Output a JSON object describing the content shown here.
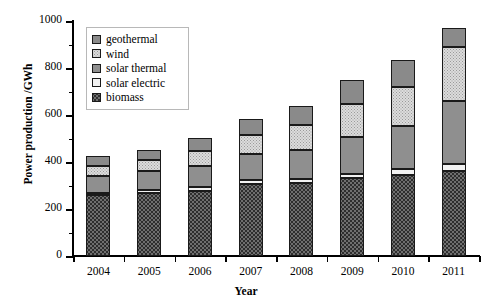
{
  "chart_data": {
    "type": "bar",
    "stacked": true,
    "title": "",
    "xlabel": "Year",
    "ylabel": "Power production /GWh",
    "categories": [
      "2004",
      "2005",
      "2006",
      "2007",
      "2008",
      "2009",
      "2010",
      "2011"
    ],
    "ylim": [
      0,
      1000
    ],
    "y_major_ticks": [
      0,
      200,
      400,
      600,
      800,
      1000
    ],
    "y_minor_ticks": [
      100,
      300,
      500,
      700,
      900
    ],
    "y_tick_labels": [
      "0",
      "200",
      "400",
      "600",
      "800",
      "1000"
    ],
    "grid": false,
    "legend_position": "top-left-inside",
    "stack_order_bottom_to_top": [
      "biomass",
      "solar electric",
      "solar thermal",
      "wind",
      "geothermal"
    ],
    "series": [
      {
        "name": "biomass",
        "color": "#6f6f6f",
        "pattern": "dense-dots",
        "values": [
          258,
          268,
          278,
          308,
          310,
          330,
          345,
          363
        ]
      },
      {
        "name": "solar electric",
        "color": "#f2f2f2",
        "pattern": "solid",
        "values": [
          12,
          14,
          15,
          15,
          18,
          20,
          25,
          28
        ]
      },
      {
        "name": "solar thermal",
        "color": "#8f8f8f",
        "pattern": "solid",
        "values": [
          72,
          78,
          90,
          112,
          125,
          155,
          185,
          268
        ]
      },
      {
        "name": "wind",
        "color": "#dcdcdc",
        "pattern": "light-dots",
        "values": [
          42,
          50,
          65,
          80,
          105,
          140,
          165,
          230
        ]
      },
      {
        "name": "geothermal",
        "color": "#8a8a8a",
        "pattern": "solid",
        "values": [
          42,
          40,
          55,
          70,
          82,
          105,
          115,
          81
        ]
      }
    ],
    "totals": [
      426,
      450,
      503,
      585,
      640,
      750,
      835,
      970
    ]
  },
  "legend": {
    "items": [
      {
        "label": "geothermal"
      },
      {
        "label": "wind"
      },
      {
        "label": "solar thermal"
      },
      {
        "label": "solar electric"
      },
      {
        "label": "biomass"
      }
    ]
  }
}
